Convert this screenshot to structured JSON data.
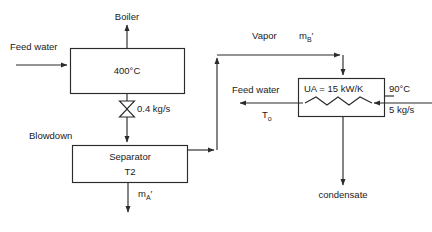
{
  "diagram": {
    "stroke_color": "#2b2b2b",
    "text_color": "#1a1a1a",
    "background": "#ffffff"
  },
  "labels": {
    "boiler_outlet": "Boiler",
    "feed_water_inlet": "Feed water",
    "boiler_temp": "400°C",
    "valve_flow": "0.4 kg/s",
    "blowdown": "Blowdown",
    "separator_name": "Separator",
    "separator_temp": "T2",
    "vapor": "Vapor",
    "vapor_flow_base": "m",
    "vapor_flow_sub": "B",
    "vapor_flow_prime": "′",
    "separator_liquid_base": "m",
    "separator_liquid_sub": "A",
    "separator_liquid_prime": "′",
    "hx_feed_water": "Feed water",
    "hx_outlet_temp_base": "T",
    "hx_outlet_temp_sub": "o",
    "hx_ua": "UA = 15 kW/K",
    "hx_hot_temp": "90°C",
    "hx_hot_flow": "5 kg/s",
    "condensate": "condensate"
  },
  "components": {
    "boiler": {
      "name": "boiler-vessel",
      "label": "400°C"
    },
    "separator": {
      "name": "separator-vessel",
      "line1": "Separator",
      "line2": "T2"
    },
    "heat_exchanger": {
      "name": "heat-exchanger-vessel",
      "label": "UA = 15 kW/K"
    },
    "valve": {
      "name": "blowdown-valve",
      "label": "0.4 kg/s"
    }
  },
  "streams": [
    {
      "name": "feed-water-to-boiler",
      "label": "Feed water",
      "direction": "right"
    },
    {
      "name": "boiler-steam-out",
      "label": "Boiler",
      "direction": "up"
    },
    {
      "name": "boiler-blowdown-to-separator",
      "label": "0.4 kg/s",
      "direction": "down"
    },
    {
      "name": "separator-vapor-to-hx",
      "label": "Vapor",
      "direction": "up-right"
    },
    {
      "name": "separator-liquid-out",
      "label": "mA′",
      "direction": "down"
    },
    {
      "name": "hx-hot-inlet",
      "label": "90°C / 5 kg/s",
      "direction": "left"
    },
    {
      "name": "hx-feedwater-out",
      "label": "Feed water",
      "direction": "left"
    },
    {
      "name": "hx-condensate-out",
      "label": "condensate",
      "direction": "down"
    }
  ]
}
